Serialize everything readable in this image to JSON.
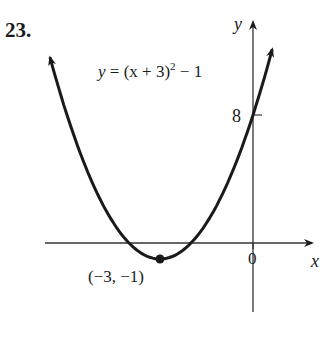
{
  "problem_number": "23.",
  "equation": {
    "lhs": "y",
    "rhs_base": "= (x + 3)",
    "exponent": "2",
    "rhs_tail": " − 1"
  },
  "axes": {
    "x_label": "x",
    "y_label": "y",
    "origin_label": "0"
  },
  "tick_label_y": "8",
  "vertex_label": "(−3, −1)",
  "colors": {
    "curve": "#1a1a1a",
    "axes": "#333333",
    "background": "#ffffff"
  },
  "chart_data": {
    "type": "line",
    "xlabel": "x",
    "ylabel": "y",
    "function": "y = (x + 3)^2 - 1",
    "vertex": [
      -3,
      -1
    ],
    "y_intercept": [
      0,
      8
    ],
    "x_intercepts": [
      -4,
      -2
    ],
    "annotations": [
      {
        "text": "(−3, −1)",
        "point": [
          -3,
          -1
        ]
      },
      {
        "text": "8",
        "point": [
          0,
          8
        ]
      }
    ],
    "x": [
      -6.5,
      -6,
      -5,
      -4,
      -3,
      -2,
      -1,
      0,
      0.5
    ],
    "series": [
      {
        "name": "y = (x + 3)^2 − 1",
        "values": [
          11.25,
          8,
          3,
          0,
          -1,
          0,
          3,
          8,
          11.25
        ]
      }
    ],
    "xlim": [
      -6.8,
      1.7
    ],
    "ylim": [
      -4,
      12
    ],
    "grid": false,
    "legend": "none"
  }
}
